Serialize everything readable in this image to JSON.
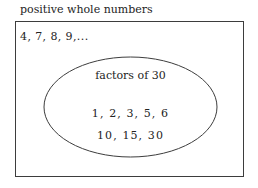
{
  "diagram": {
    "type": "set-venn-diagram",
    "universe": {
      "label": "positive whole numbers",
      "outside_elements": "4, 7, 8, 9,..."
    },
    "subset": {
      "label": "factors of 30",
      "rows": [
        "1, 2, 3, 5, 6",
        "10, 15, 30"
      ]
    },
    "colors": {
      "stroke": "#3d3d3d",
      "text": "#232323",
      "background": "#ffffff"
    }
  }
}
